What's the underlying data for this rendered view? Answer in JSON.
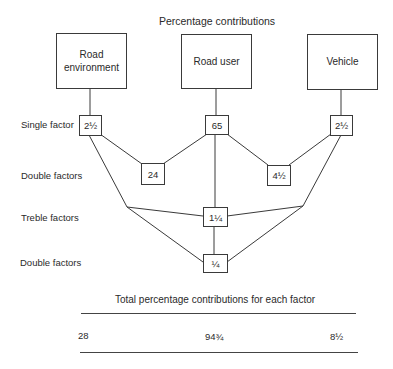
{
  "title": "Percentage contributions",
  "factors": [
    {
      "label": "Road environment",
      "line1": "Road",
      "line2": "environment"
    },
    {
      "label": "Road user"
    },
    {
      "label": "Vehicle"
    }
  ],
  "row_labels": {
    "single": "Single factor",
    "double1": "Double factors",
    "treble": "Treble factors",
    "double2": "Double factors"
  },
  "values": {
    "single_road_environment": "2½",
    "single_road_user": "65",
    "single_vehicle": "2½",
    "double_env_user": "24",
    "double_user_vehicle": "4½",
    "treble_all": "1¼",
    "double_env_vehicle": "¼"
  },
  "totals": {
    "title": "Total percentage contributions for each factor",
    "road_environment": "28",
    "road_user": "94¾",
    "vehicle": "8½"
  }
}
